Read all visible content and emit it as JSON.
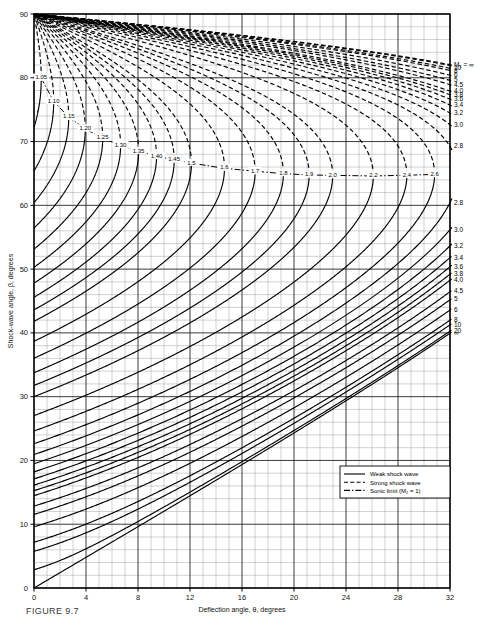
{
  "figure": {
    "caption": "FIGURE 9.7"
  },
  "axes": {
    "x": {
      "label": "Deflection angle, θ, degrees",
      "min": 0,
      "max": 32,
      "ticks": [
        "0",
        "4",
        "8",
        "12",
        "16",
        "20",
        "24",
        "28",
        "32"
      ],
      "tick_values": [
        0,
        4,
        8,
        12,
        16,
        20,
        24,
        28,
        32
      ],
      "minor_step": 1
    },
    "y": {
      "label": "Shock-wave angle, β, degrees",
      "min": 0,
      "max": 90,
      "ticks": [
        "0",
        "10",
        "20",
        "30",
        "40",
        "50",
        "60",
        "70",
        "80",
        "90"
      ],
      "tick_values": [
        0,
        10,
        20,
        30,
        40,
        50,
        60,
        70,
        80,
        90
      ],
      "minor_step": 2
    }
  },
  "legend": {
    "items": [
      {
        "label": "Weak shock wave",
        "style": "solid"
      },
      {
        "label": "Strong shock wave",
        "style": "dashed"
      },
      {
        "label": "Sonic limit (M₂ = 1)",
        "style": "dashdot"
      }
    ]
  },
  "chart_data": {
    "type": "line",
    "xlabel": "Deflection angle, θ, degrees",
    "ylabel": "Shock-wave angle, β, degrees",
    "xlim": [
      0,
      32
    ],
    "ylim": [
      0,
      90
    ],
    "grid": true,
    "legend_position": "inside-lower-right",
    "gamma": 1.4,
    "series_variable": "M₁",
    "mach_numbers": [
      1.05,
      1.1,
      1.15,
      1.2,
      1.25,
      1.3,
      1.35,
      1.4,
      1.45,
      1.5,
      1.6,
      1.7,
      1.8,
      1.9,
      2.0,
      2.2,
      2.4,
      2.6,
      2.8,
      3.0,
      3.2,
      3.4,
      3.6,
      3.8,
      4.0,
      4.5,
      5,
      6,
      8,
      10,
      20,
      10000
    ],
    "inline_labels": [
      {
        "text": "1.05",
        "mach": 1.05
      },
      {
        "text": "1.10",
        "mach": 1.1
      },
      {
        "text": "1.15",
        "mach": 1.15
      },
      {
        "text": "1.20",
        "mach": 1.2
      },
      {
        "text": "1.25",
        "mach": 1.25
      },
      {
        "text": "1.30",
        "mach": 1.3
      },
      {
        "text": "1.35",
        "mach": 1.35
      },
      {
        "text": "1.40",
        "mach": 1.4
      },
      {
        "text": "1.45",
        "mach": 1.45
      },
      {
        "text": "1.5",
        "mach": 1.5
      },
      {
        "text": "1.6",
        "mach": 1.6
      },
      {
        "text": "1.7",
        "mach": 1.7
      },
      {
        "text": "1.8",
        "mach": 1.8
      },
      {
        "text": "1.9",
        "mach": 1.9
      },
      {
        "text": "2.0",
        "mach": 2.0
      },
      {
        "text": "2.2",
        "mach": 2.2
      },
      {
        "text": "2.4",
        "mach": 2.4
      },
      {
        "text": "2.6",
        "mach": 2.6
      }
    ],
    "right_axis_top_labels": [
      {
        "text": "M₁ = ∞",
        "mach": 10000
      },
      {
        "text": "10",
        "mach": 10
      },
      {
        "text": "8",
        "mach": 8
      },
      {
        "text": "6",
        "mach": 6
      },
      {
        "text": "5",
        "mach": 5
      },
      {
        "text": "4.5",
        "mach": 4.5
      },
      {
        "text": "4.0",
        "mach": 4.0
      },
      {
        "text": "3.8",
        "mach": 3.8
      },
      {
        "text": "3.6",
        "mach": 3.6
      },
      {
        "text": "3.4",
        "mach": 3.4
      },
      {
        "text": "3.2",
        "mach": 3.2
      },
      {
        "text": "3.0",
        "mach": 3.0
      },
      {
        "text": "2.8",
        "mach": 2.8
      }
    ],
    "right_axis_bottom_labels": [
      {
        "text": "2.8",
        "mach": 2.8
      },
      {
        "text": "3.0",
        "mach": 3.0
      },
      {
        "text": "3.2",
        "mach": 3.2
      },
      {
        "text": "3.4",
        "mach": 3.4
      },
      {
        "text": "3.6",
        "mach": 3.6
      },
      {
        "text": "3.8",
        "mach": 3.8
      },
      {
        "text": "4.0",
        "mach": 4.0
      },
      {
        "text": "4.5",
        "mach": 4.5
      },
      {
        "text": "5",
        "mach": 5
      },
      {
        "text": "6",
        "mach": 6
      },
      {
        "text": "8",
        "mach": 8
      },
      {
        "text": "10",
        "mach": 10
      },
      {
        "text": "20",
        "mach": 20
      },
      {
        "text": "∞",
        "mach": 10000
      }
    ]
  }
}
